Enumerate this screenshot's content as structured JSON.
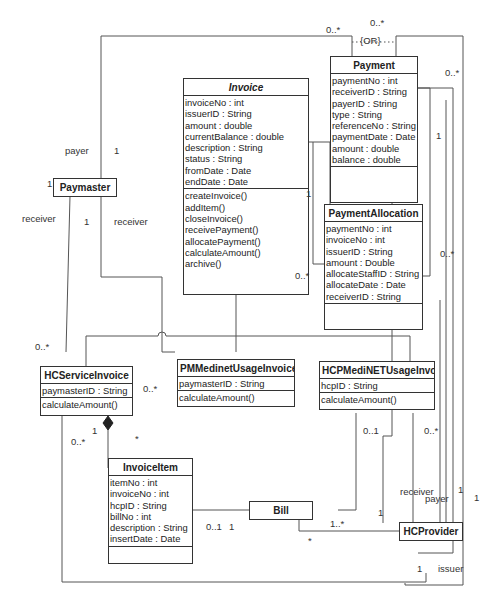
{
  "diagram": {
    "type": "UML class diagram",
    "classes": {
      "invoice": {
        "name": "Invoice",
        "attributes": [
          "invoiceNo : int",
          "issuerID : String",
          "amount : double",
          "currentBalance : double",
          "description : String",
          "status : String",
          "fromDate : Date",
          "endDate : Date"
        ],
        "operations": [
          "createInvoice()",
          "addItem()",
          "closeInvoice()",
          "receivePayment()",
          "allocatePayment()",
          "calculateAmount()",
          "archive()"
        ]
      },
      "payment": {
        "name": "Payment",
        "attributes": [
          "paymentNo : int",
          "receiverID : String",
          "payerID : String",
          "type : String",
          "referenceNo : String",
          "paymentDate : Date",
          "amount : double",
          "balance : double"
        ]
      },
      "payment_allocation": {
        "name": "PaymentAllocation",
        "attributes": [
          "paymentNo : int",
          "invoiceNo : int",
          "issuerID : String",
          "amount : Double",
          "allocateStaffID : String",
          "allocateDate : Date",
          "receiverID : String"
        ]
      },
      "hc_service_invoice": {
        "name": "HCServiceInvoice",
        "attributes": [
          "paymasterID : String"
        ],
        "operations": [
          "calculateAmount()"
        ]
      },
      "pm_medinet_usage_invoice": {
        "name": "PMMedinetUsageInvoice",
        "attributes": [
          "paymasterID : String"
        ],
        "operations": [
          "calculateAmount()"
        ]
      },
      "hcp_medinet_usage_invoice": {
        "name": "HCPMediNETUsageInvoice",
        "attributes": [
          "hcpID : String"
        ],
        "operations": [
          "calculateAmount()"
        ]
      },
      "invoice_item": {
        "name": "InvoiceItem",
        "attributes": [
          "itemNo : int",
          "invoiceNo : int",
          "hcpID : String",
          "billNo : int",
          "description : String",
          "insertDate : Date"
        ]
      },
      "paymaster": {
        "name": "Paymaster"
      },
      "bill": {
        "name": "Bill"
      },
      "hc_provider": {
        "name": "HCProvider"
      }
    },
    "labels": {
      "or_constraint": "{OR}",
      "pay_top_left": "0..*",
      "pay_top_mid": "0..*",
      "pay_right": "0..*",
      "payer": "payer",
      "payer_one": "1",
      "paymaster_one": "1",
      "receiver_left": "receiver",
      "receiver_mid": "receiver",
      "paymaster_receiver_one": "1",
      "inv_alloc_one": "1",
      "inv_alloc_many": "0..*",
      "pay_alloc_one": "1",
      "hcprov_many_right": "0..*",
      "hcsi_many_top": "0..*",
      "pmmui_many": "0..*",
      "hcsi_compose_one": "1",
      "hcsi_many_bottom": "0..*",
      "item_many": "*",
      "hcpmui_bill": "0..1",
      "hcpmui_many": "0..*",
      "item_bill_01": "0..1",
      "item_bill_1": "1",
      "bill_right_one": "1",
      "bill_hcprov_many": "1..*",
      "bill_star": "*",
      "hcprov_receiver": "receiver",
      "hcprov_payer": "payer",
      "hcprov_one_a": "1",
      "hcprov_one_b": "1",
      "hcprov_issuer_one": "1",
      "issuer": "issuer"
    }
  }
}
